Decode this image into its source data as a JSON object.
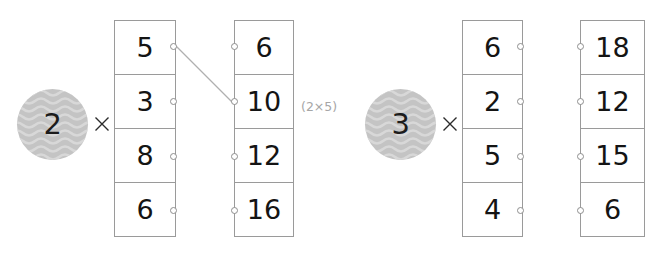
{
  "diagram": {
    "groups": [
      {
        "id": "group-1",
        "multiplier": "2",
        "operator": "×",
        "input_column": {
          "label": "input-column-1",
          "values": [
            "5",
            "3",
            "8",
            "6"
          ]
        },
        "output_column": {
          "label": "output-column-1",
          "values": [
            "6",
            "10",
            "12",
            "16"
          ]
        },
        "annotation": "(2×5)",
        "connection": {
          "from_row": 0,
          "to_row": 1,
          "from_value": "5",
          "to_value": "10"
        }
      },
      {
        "id": "group-2",
        "multiplier": "3",
        "operator": "×",
        "input_column": {
          "label": "input-column-2",
          "values": [
            "6",
            "2",
            "5",
            "4"
          ]
        },
        "output_column": {
          "label": "output-column-2",
          "values": [
            "18",
            "12",
            "15",
            "6"
          ]
        },
        "annotation": "",
        "connection": null
      }
    ],
    "colors": {
      "token_fill": "#c4c4c4",
      "token_wave": "#d8d8d8",
      "cell_border": "#9a9a9a",
      "value_text": "#141414",
      "annotation_text": "#a6a6a6",
      "port_stroke": "#8e8e8e",
      "wire_stroke": "#b0b0b0",
      "background": "#ffffff"
    }
  }
}
